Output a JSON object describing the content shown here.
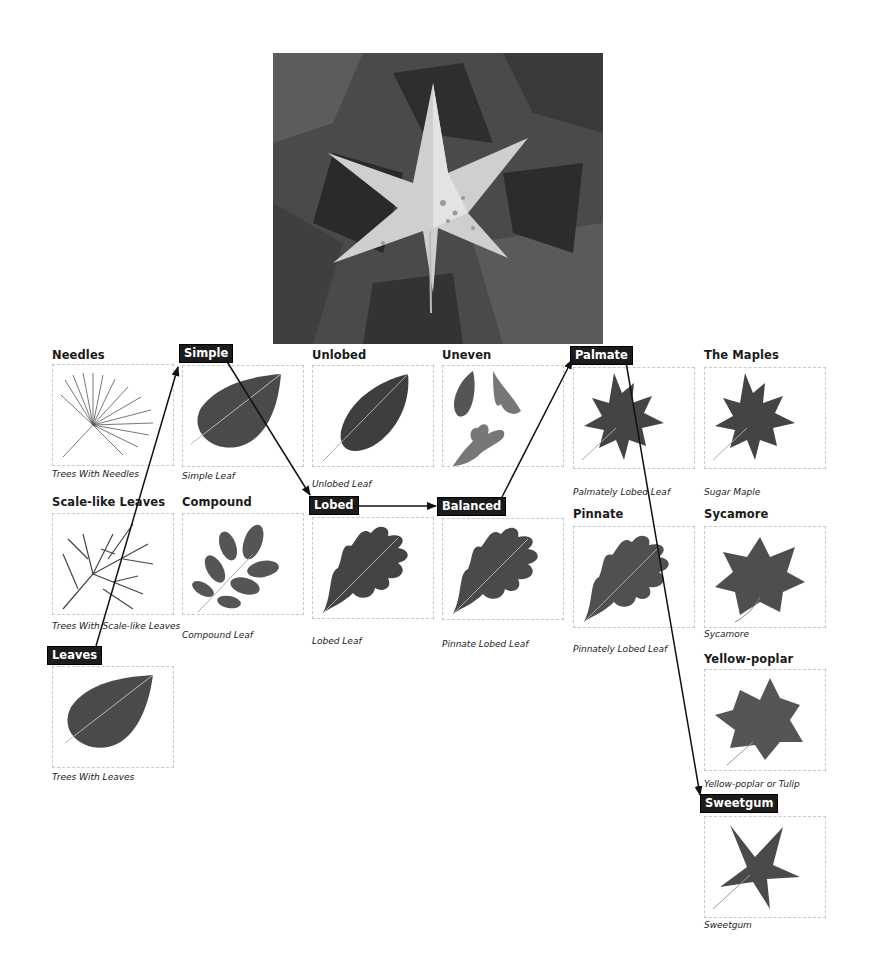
{
  "photo": {
    "label": "Sweetgum leaf photograph"
  },
  "nodes": {
    "needles": {
      "heading": "Needles",
      "caption": "Trees With Needles"
    },
    "scale": {
      "heading": "Scale-like Leaves",
      "caption": "Trees With Scale-like Leaves"
    },
    "leaves": {
      "heading": "Leaves",
      "caption": "Trees With Leaves"
    },
    "simple": {
      "heading": "Simple",
      "caption": "Simple Leaf"
    },
    "compound": {
      "heading": "Compound",
      "caption": "Compound Leaf"
    },
    "unlobed": {
      "heading": "Unlobed",
      "caption": "Unlobed Leaf"
    },
    "lobed": {
      "heading": "Lobed",
      "caption": "Lobed Leaf"
    },
    "uneven": {
      "heading": "Uneven",
      "caption": ""
    },
    "balanced": {
      "heading": "Balanced",
      "caption": "Pinnate Lobed Leaf"
    },
    "palmate": {
      "heading": "Palmate",
      "caption": "Palmately Lobed Leaf"
    },
    "pinnate": {
      "heading": "Pinnate",
      "caption": "Pinnately Lobed Leaf"
    },
    "maples": {
      "heading": "The Maples",
      "caption": "Sugar Maple"
    },
    "sycamore": {
      "heading": "Sycamore",
      "caption": "Sycamore"
    },
    "yellowpoplar": {
      "heading": "Yellow-poplar",
      "caption": "Yellow-poplar or Tulip"
    },
    "sweetgum": {
      "heading": "Sweetgum",
      "caption": "Sweetgum"
    }
  },
  "path": [
    "Leaves",
    "Simple",
    "Lobed",
    "Balanced",
    "Palmate",
    "Sweetgum"
  ],
  "colors": {
    "badge_bg": "#1c1c1c",
    "badge_text": "#ffffff",
    "arrow": "#111111",
    "card_border": "#c9c9c9"
  }
}
